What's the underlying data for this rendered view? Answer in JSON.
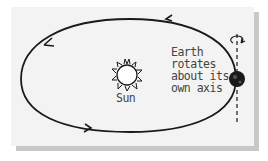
{
  "diagram": {
    "sun_label": "Sun",
    "earth_label_lines": [
      "Earth",
      "rotates",
      "about its",
      "own axis"
    ],
    "colors": {
      "background": "#f3f3f3",
      "shadow": "#c8c8c8",
      "stroke": "#1a1a1a",
      "text": "#444444"
    }
  }
}
